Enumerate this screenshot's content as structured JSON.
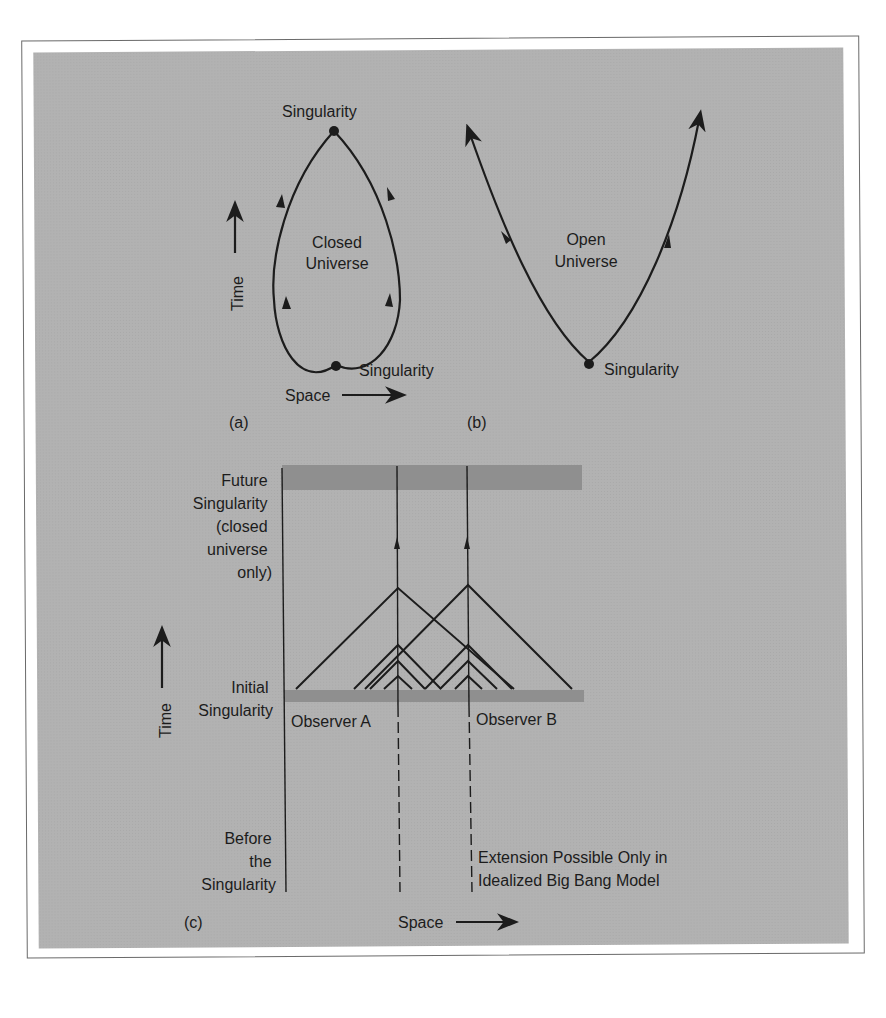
{
  "figure": {
    "panel_a": {
      "label": "(a)",
      "top_label": "Singularity",
      "bottom_label": "Singularity",
      "center_line1": "Closed",
      "center_line2": "Universe",
      "time_axis": "Time",
      "space_axis": "Space"
    },
    "panel_b": {
      "label": "(b)",
      "bottom_label": "Singularity",
      "center_line1": "Open",
      "center_line2": "Universe"
    },
    "panel_c": {
      "label": "(c)",
      "future_label": [
        "Future",
        "Singularity",
        "(closed",
        "universe",
        "only)"
      ],
      "initial_label": [
        "Initial",
        "Singularity"
      ],
      "before_label": [
        "Before",
        "the",
        "Singularity"
      ],
      "observer_a": "Observer A",
      "observer_b": "Observer B",
      "extension_line1": "Extension Possible Only in",
      "extension_line2": "Idealized Big Bang Model",
      "time_axis": "Time",
      "space_axis": "Space"
    },
    "colors": {
      "background": "#b2b2b2",
      "band": "#8f8f8f",
      "ink": "#1c1c1c"
    }
  }
}
